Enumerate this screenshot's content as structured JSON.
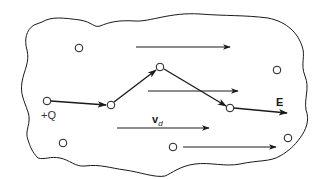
{
  "diagram": {
    "colors": {
      "stroke": "#1a1a1a",
      "background": "#ffffff"
    },
    "labels": {
      "charge": "+Q",
      "field": "E",
      "drift_velocity_main": "v",
      "drift_velocity_sub": "d"
    },
    "boundary": {
      "shape": "irregular closed outline (conductor)"
    },
    "lattice_points": [
      {
        "x": 79,
        "y": 48
      },
      {
        "x": 277,
        "y": 70
      },
      {
        "x": 63,
        "y": 143
      },
      {
        "x": 173,
        "y": 147
      },
      {
        "x": 288,
        "y": 138
      }
    ],
    "path_points": [
      {
        "x": 47,
        "y": 101,
        "label": "+Q"
      },
      {
        "x": 111,
        "y": 105
      },
      {
        "x": 160,
        "y": 67
      },
      {
        "x": 230,
        "y": 108
      }
    ],
    "field_arrows": [
      {
        "x1": 136,
        "y1": 47,
        "x2": 230,
        "y2": 47
      },
      {
        "x1": 148,
        "y1": 91,
        "x2": 238,
        "y2": 91
      },
      {
        "x1": 117,
        "y1": 128,
        "x2": 209,
        "y2": 128
      },
      {
        "x1": 183,
        "y1": 147,
        "x2": 276,
        "y2": 147
      }
    ]
  }
}
